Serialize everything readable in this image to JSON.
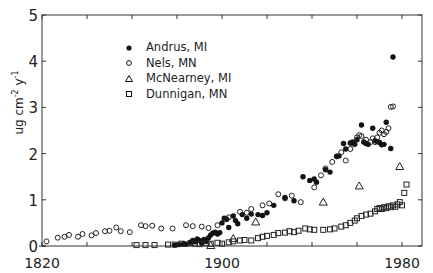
{
  "chart_data": {
    "type": "scatter",
    "title": "",
    "xlabel": "",
    "ylabel": "ug cm-2 y-1",
    "ylabel_parts": {
      "base1": "ug cm",
      "exp1": "-2",
      "base2": " y",
      "exp2": "-1"
    },
    "xlim": [
      1820,
      1988
    ],
    "ylim": [
      0,
      5
    ],
    "x_ticks": [
      1820,
      1840,
      1860,
      1880,
      1900,
      1920,
      1940,
      1960,
      1980
    ],
    "x_tick_labels": [
      "1820",
      "1900",
      "1980"
    ],
    "y_ticks": [
      0,
      1,
      2,
      3,
      4,
      5
    ],
    "y_tick_labels": [
      "0",
      "1",
      "2",
      "3",
      "4",
      "5"
    ],
    "grid": false,
    "legend_position": "upper-left",
    "series": [
      {
        "name": "Andrus, MI",
        "marker": "filled-circle",
        "points": [
          [
            1879,
            0.02
          ],
          [
            1881,
            0.03
          ],
          [
            1883,
            0.05
          ],
          [
            1884,
            0.04
          ],
          [
            1886,
            0.08
          ],
          [
            1887,
            0.12
          ],
          [
            1888,
            0.09
          ],
          [
            1889,
            0.15
          ],
          [
            1890,
            0.12
          ],
          [
            1891,
            0.06
          ],
          [
            1892,
            0.14
          ],
          [
            1893,
            0.1
          ],
          [
            1894,
            0.18
          ],
          [
            1895,
            0.24
          ],
          [
            1896,
            0.28
          ],
          [
            1897,
            0.3
          ],
          [
            1898,
            0.26
          ],
          [
            1899,
            0.29
          ],
          [
            1900,
            0.5
          ],
          [
            1901,
            0.6
          ],
          [
            1902,
            0.58
          ],
          [
            1903,
            0.4
          ],
          [
            1905,
            0.65
          ],
          [
            1906,
            0.55
          ],
          [
            1907,
            0.48
          ],
          [
            1909,
            0.68
          ],
          [
            1911,
            0.6
          ],
          [
            1913,
            0.69
          ],
          [
            1916,
            0.68
          ],
          [
            1918,
            0.66
          ],
          [
            1920,
            0.72
          ],
          [
            1923,
            0.88
          ],
          [
            1928,
            1.05
          ],
          [
            1932,
            0.98
          ],
          [
            1936,
            1.5
          ],
          [
            1939,
            1.42
          ],
          [
            1941,
            1.45
          ],
          [
            1942,
            1.38
          ],
          [
            1946,
            1.65
          ],
          [
            1948,
            1.6
          ],
          [
            1951,
            1.94
          ],
          [
            1952,
            1.95
          ],
          [
            1954,
            2.22
          ],
          [
            1955,
            2.1
          ],
          [
            1957,
            2.23
          ],
          [
            1958,
            2.25
          ],
          [
            1959,
            2.2
          ],
          [
            1960,
            2.3
          ],
          [
            1962,
            2.62
          ],
          [
            1963,
            2.25
          ],
          [
            1964,
            2.22
          ],
          [
            1965,
            2.2
          ],
          [
            1967,
            2.55
          ],
          [
            1968,
            2.28
          ],
          [
            1969,
            2.26
          ],
          [
            1970,
            2.24
          ],
          [
            1971,
            2.19
          ],
          [
            1972,
            2.2
          ],
          [
            1973,
            2.68
          ],
          [
            1975,
            2.11
          ],
          [
            1976,
            4.09
          ]
        ]
      },
      {
        "name": "Nels, MN",
        "marker": "open-circle",
        "points": [
          [
            1822,
            0.1
          ],
          [
            1827,
            0.18
          ],
          [
            1830,
            0.2
          ],
          [
            1832,
            0.24
          ],
          [
            1836,
            0.2
          ],
          [
            1838,
            0.26
          ],
          [
            1842,
            0.23
          ],
          [
            1844,
            0.28
          ],
          [
            1848,
            0.32
          ],
          [
            1850,
            0.33
          ],
          [
            1853,
            0.4
          ],
          [
            1855,
            0.32
          ],
          [
            1859,
            0.3
          ],
          [
            1864,
            0.45
          ],
          [
            1866,
            0.43
          ],
          [
            1869,
            0.44
          ],
          [
            1873,
            0.38
          ],
          [
            1878,
            0.38
          ],
          [
            1884,
            0.45
          ],
          [
            1887,
            0.43
          ],
          [
            1891,
            0.42
          ],
          [
            1894,
            0.39
          ],
          [
            1898,
            0.45
          ],
          [
            1902,
            0.58
          ],
          [
            1903,
            0.62
          ],
          [
            1908,
            0.74
          ],
          [
            1911,
            0.72
          ],
          [
            1913,
            0.8
          ],
          [
            1918,
            0.88
          ],
          [
            1921,
            0.92
          ],
          [
            1925,
            1.12
          ],
          [
            1928,
            1.03
          ],
          [
            1931,
            1.09
          ],
          [
            1935,
            0.95
          ],
          [
            1941,
            1.27
          ],
          [
            1944,
            1.53
          ],
          [
            1946,
            1.68
          ],
          [
            1949,
            1.82
          ],
          [
            1951,
            1.94
          ],
          [
            1953,
            2.03
          ],
          [
            1955,
            1.85
          ],
          [
            1957,
            2.1
          ],
          [
            1958,
            2.22
          ],
          [
            1960,
            2.35
          ],
          [
            1961,
            2.4
          ],
          [
            1962,
            2.38
          ],
          [
            1964,
            2.3
          ],
          [
            1966,
            2.25
          ],
          [
            1967,
            2.33
          ],
          [
            1968,
            2.25
          ],
          [
            1969,
            2.35
          ],
          [
            1970,
            2.45
          ],
          [
            1971,
            2.5
          ],
          [
            1972,
            2.42
          ],
          [
            1973,
            2.47
          ],
          [
            1974,
            2.55
          ],
          [
            1975,
            3.01
          ],
          [
            1976,
            3.02
          ]
        ]
      },
      {
        "name": "McNearney, MI",
        "marker": "open-triangle",
        "points": [
          [
            1895,
            0.01
          ],
          [
            1905,
            0.16
          ],
          [
            1915,
            0.52
          ],
          [
            1945,
            0.95
          ],
          [
            1961,
            1.3
          ],
          [
            1979,
            1.72
          ]
        ]
      },
      {
        "name": "Dunnigan, MN",
        "marker": "open-square",
        "points": [
          [
            1862,
            0.02
          ],
          [
            1866,
            0.02
          ],
          [
            1870,
            0.02
          ],
          [
            1876,
            0.03
          ],
          [
            1879,
            0.03
          ],
          [
            1882,
            0.05
          ],
          [
            1886,
            0.06
          ],
          [
            1888,
            0.05
          ],
          [
            1890,
            0.04
          ],
          [
            1893,
            0.06
          ],
          [
            1895,
            0.05
          ],
          [
            1898,
            0.07
          ],
          [
            1900,
            0.05
          ],
          [
            1903,
            0.08
          ],
          [
            1905,
            0.1
          ],
          [
            1908,
            0.12
          ],
          [
            1910,
            0.13
          ],
          [
            1913,
            0.12
          ],
          [
            1916,
            0.17
          ],
          [
            1918,
            0.2
          ],
          [
            1920,
            0.22
          ],
          [
            1923,
            0.24
          ],
          [
            1925,
            0.28
          ],
          [
            1928,
            0.29
          ],
          [
            1930,
            0.32
          ],
          [
            1932,
            0.3
          ],
          [
            1934,
            0.33
          ],
          [
            1937,
            0.38
          ],
          [
            1939,
            0.36
          ],
          [
            1941,
            0.35
          ],
          [
            1945,
            0.35
          ],
          [
            1948,
            0.36
          ],
          [
            1950,
            0.38
          ],
          [
            1953,
            0.42
          ],
          [
            1955,
            0.45
          ],
          [
            1957,
            0.5
          ],
          [
            1959,
            0.55
          ],
          [
            1960,
            0.6
          ],
          [
            1962,
            0.65
          ],
          [
            1964,
            0.68
          ],
          [
            1966,
            0.7
          ],
          [
            1968,
            0.75
          ],
          [
            1969,
            0.8
          ],
          [
            1970,
            0.82
          ],
          [
            1971,
            0.8
          ],
          [
            1972,
            0.84
          ],
          [
            1973,
            0.82
          ],
          [
            1974,
            0.86
          ],
          [
            1975,
            0.84
          ],
          [
            1976,
            0.88
          ],
          [
            1977,
            0.85
          ],
          [
            1978,
            0.9
          ],
          [
            1979,
            0.95
          ],
          [
            1980,
            0.88
          ],
          [
            1981,
            1.15
          ],
          [
            1982,
            1.33
          ]
        ]
      }
    ]
  }
}
